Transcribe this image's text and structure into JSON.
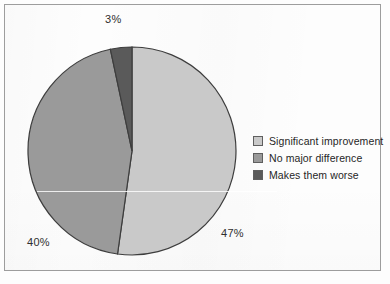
{
  "chart_data": {
    "type": "pie",
    "title": "",
    "subtitle": "",
    "xlabel": "",
    "ylabel": "",
    "grid": false,
    "legend_position": "right",
    "start_angle_deg": 0,
    "direction": "clockwise",
    "categories": [
      "Significant improvement",
      "No major difference",
      "Makes them worse"
    ],
    "values": [
      47,
      40,
      3
    ],
    "value_unit": "%",
    "data_labels": [
      "47%",
      "40%",
      "3%"
    ],
    "colors": [
      "#c9c9c9",
      "#9a9a9a",
      "#5a5a5a"
    ],
    "slices": [
      {
        "label": "Significant improvement",
        "value": 47,
        "data_label": "47%",
        "color": "#c9c9c9",
        "start_angle_deg": 0,
        "end_angle_deg": 169.2
      },
      {
        "label": "No major difference",
        "value": 40,
        "data_label": "40%",
        "color": "#9a9a9a",
        "start_angle_deg": 169.2,
        "end_angle_deg": 313.2
      },
      {
        "label": "Makes them worse",
        "value": 3,
        "data_label": "3%",
        "color": "#5a5a5a",
        "start_angle_deg": 313.2,
        "end_angle_deg": 360
      }
    ]
  },
  "labels": {
    "significant_improvement_pct": "47%",
    "no_major_difference_pct": "40%",
    "makes_them_worse_pct": "3%"
  },
  "legend": {
    "items": [
      {
        "label": "Significant improvement",
        "color": "#c9c9c9"
      },
      {
        "label": "No major difference",
        "color": "#9a9a9a"
      },
      {
        "label": "Makes them worse",
        "color": "#5a5a5a"
      }
    ]
  },
  "style": {
    "slice_outline": "#3d3d3d",
    "frame_border": "#9d9d9d",
    "background": "#fdfdfd",
    "text_color": "#2f2f2f"
  }
}
